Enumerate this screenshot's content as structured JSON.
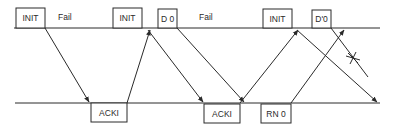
{
  "diagram": {
    "type": "message-sequence / timing diagram",
    "timelines": [
      {
        "name": "sender",
        "y": 28,
        "x1": 14,
        "x2": 380
      },
      {
        "name": "receiver",
        "y": 103,
        "x1": 15,
        "x2": 380
      }
    ],
    "top_boxes": [
      {
        "label": "INIT",
        "x": 16,
        "y": 8,
        "w": 29,
        "h": 20
      },
      {
        "label": "INIT",
        "x": 113,
        "y": 8,
        "w": 29,
        "h": 20
      },
      {
        "label": "D 0",
        "x": 158,
        "y": 9,
        "w": 19,
        "h": 19
      },
      {
        "label": "INIT",
        "x": 263,
        "y": 9,
        "w": 29,
        "h": 19
      },
      {
        "label": "D'0",
        "x": 312,
        "y": 10,
        "w": 19,
        "h": 18
      }
    ],
    "bottom_boxes": [
      {
        "label": "ACKI",
        "x": 91,
        "y": 103,
        "w": 36,
        "h": 19
      },
      {
        "label": "ACKI",
        "x": 204,
        "y": 104,
        "w": 36,
        "h": 19
      },
      {
        "label": "RN 0",
        "x": 261,
        "y": 104,
        "w": 30,
        "h": 19
      }
    ],
    "annotations": [
      {
        "label": "Fail",
        "x": 58,
        "y": 20
      },
      {
        "label": "Fail",
        "x": 199,
        "y": 20
      }
    ],
    "messages": [
      {
        "from": [
          45,
          28
        ],
        "to": [
          89,
          102
        ],
        "arrow": true,
        "lost": false
      },
      {
        "from": [
          127,
          103
        ],
        "to": [
          150,
          30
        ],
        "arrow": true,
        "lost": false
      },
      {
        "from": [
          148,
          30
        ],
        "to": [
          203,
          102
        ],
        "arrow": true,
        "lost": false
      },
      {
        "from": [
          177,
          28
        ],
        "to": [
          244,
          102
        ],
        "arrow": true,
        "lost": false
      },
      {
        "from": [
          240,
          103
        ],
        "to": [
          298,
          30
        ],
        "arrow": true,
        "lost": false
      },
      {
        "from": [
          297,
          30
        ],
        "to": [
          377,
          102
        ],
        "arrow": true,
        "lost": false
      },
      {
        "from": [
          291,
          103
        ],
        "to": [
          344,
          30
        ],
        "arrow": true,
        "lost": false
      },
      {
        "from": [
          331,
          28
        ],
        "to": [
          368,
          77
        ],
        "arrow": false,
        "lost": true,
        "lost_mark": [
          353,
          58
        ]
      }
    ]
  }
}
